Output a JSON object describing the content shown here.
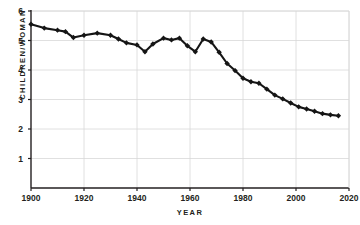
{
  "chart_data": {
    "type": "line",
    "title": "",
    "subtitle": "",
    "xlabel": "YEAR",
    "ylabel": "CHILDREN/WOMAN",
    "xlim": [
      1900,
      2020
    ],
    "ylim": [
      0,
      6
    ],
    "xticks": [
      1900,
      1920,
      1940,
      1960,
      1980,
      2000,
      2020
    ],
    "xtick_labels": [
      "1900",
      "1920",
      "1940",
      "1960",
      "1980",
      "2000",
      "2020"
    ],
    "yticks": [
      1,
      2,
      3,
      4,
      5,
      6
    ],
    "ytick_labels": [
      "1",
      "2",
      "3",
      "4",
      "5",
      "6"
    ],
    "grid": "both",
    "legend": "none",
    "markers": "filled-square",
    "line_color": "#151515",
    "grid_color": "#d8d8d8",
    "axis_color": "#231f20",
    "background": "#ffffff",
    "series": [
      {
        "name": "Children per woman",
        "x": [
          1900,
          1905,
          1910,
          1913,
          1916,
          1920,
          1925,
          1930,
          1933,
          1936,
          1940,
          1943,
          1946,
          1950,
          1953,
          1956,
          1959,
          1962,
          1965,
          1968,
          1971,
          1974,
          1977,
          1980,
          1983,
          1986,
          1989,
          1992,
          1995,
          1998,
          2001,
          2004,
          2007,
          2010,
          2013,
          2016
        ],
        "y": [
          5.55,
          5.42,
          5.35,
          5.3,
          5.1,
          5.18,
          5.25,
          5.18,
          5.05,
          4.92,
          4.85,
          4.62,
          4.88,
          5.08,
          5.02,
          5.08,
          4.82,
          4.62,
          5.05,
          4.95,
          4.6,
          4.22,
          3.98,
          3.72,
          3.6,
          3.55,
          3.35,
          3.15,
          3.02,
          2.88,
          2.75,
          2.68,
          2.6,
          2.52,
          2.48,
          2.45
        ]
      }
    ]
  }
}
